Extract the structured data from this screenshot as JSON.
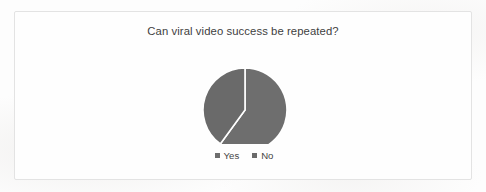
{
  "chart_data": {
    "type": "pie",
    "title": "Can viral video success be repeated?",
    "categories": [
      "Yes",
      "No"
    ],
    "values": [
      60,
      40
    ],
    "units": "percent",
    "legend_position": "bottom",
    "grid": false,
    "start_angle_deg": 0,
    "direction": "clockwise",
    "slice_colors": [
      "#6e6e6e",
      "#6a6a6a"
    ],
    "slice_border_color": "#ffffff",
    "labels_shown": false,
    "slices": [
      {
        "label": "Yes",
        "value": 60,
        "angle_deg": 216,
        "color": "#6e6e6e"
      },
      {
        "label": "No",
        "value": 40,
        "angle_deg": 144,
        "color": "#6a6a6a"
      }
    ]
  },
  "legend": {
    "items": [
      {
        "label": "Yes",
        "marker": "square-marker",
        "color": "#6e6e6e"
      },
      {
        "label": "No",
        "marker": "square-marker",
        "color": "#6a6a6a"
      }
    ]
  },
  "frame": {
    "border_color": "#e3e3e3",
    "background_color": "#fefefe"
  }
}
